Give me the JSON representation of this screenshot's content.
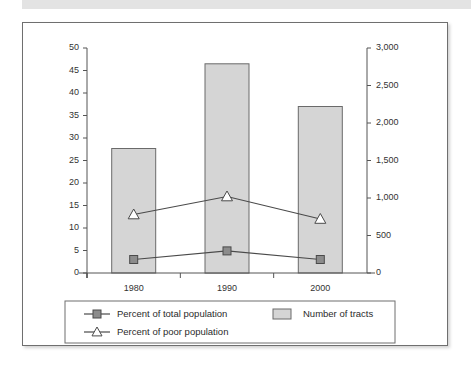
{
  "figure": {
    "background_color": "#ffffff",
    "frame_color": "#6f6f6f",
    "banner_color": "#e3e3e3"
  },
  "chart_data": {
    "type": "bar",
    "title": "",
    "subtitle": "",
    "xlabel": "",
    "ylabel": "",
    "y2label": "",
    "categories": [
      "1980",
      "1990",
      "2000"
    ],
    "grid": false,
    "legend_position": "bottom",
    "y_left": {
      "min": 0,
      "max": 50,
      "step": 5,
      "ticks": [
        "0",
        "5",
        "10",
        "15",
        "20",
        "25",
        "30",
        "35",
        "40",
        "45",
        "50"
      ],
      "tick_values": [
        0,
        5,
        10,
        15,
        20,
        25,
        30,
        35,
        40,
        45,
        50
      ]
    },
    "y_right": {
      "min": 0,
      "max": 3000,
      "step": 500,
      "ticks": [
        "0",
        "500",
        "1,000",
        "1,500",
        "2,000",
        "2,500",
        "3,000"
      ],
      "tick_values": [
        0,
        500,
        1000,
        1500,
        2000,
        2500,
        3000
      ]
    },
    "series": [
      {
        "name": "Number of tracts",
        "type": "bar",
        "axis": "right",
        "values": [
          1660,
          2790,
          2220
        ],
        "left_axis_equivalent": [
          27.7,
          46.5,
          37.0
        ],
        "fill_color": "#d5d5d5",
        "edge_color": "#6a6a6a"
      },
      {
        "name": "Percent of total population",
        "type": "line",
        "axis": "left",
        "marker": "square",
        "values": [
          3.0,
          4.9,
          3.0
        ],
        "line_color": "#4a4a4a",
        "marker_fill": "#8c8c8c"
      },
      {
        "name": "Percent of poor population",
        "type": "line",
        "axis": "left",
        "marker": "triangle",
        "values": [
          13.0,
          17.0,
          12.0
        ],
        "line_color": "#4a4a4a",
        "marker_fill": "#ffffff"
      }
    ]
  },
  "legend": {
    "entries": [
      {
        "label": "Percent of total population",
        "marker": "square-line"
      },
      {
        "label": "Number of tracts",
        "marker": "bar-swatch"
      },
      {
        "label": "Percent of poor population",
        "marker": "triangle-line"
      }
    ]
  }
}
